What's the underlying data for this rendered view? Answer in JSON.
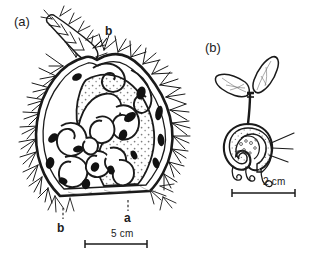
{
  "figure": {
    "background_color": "#ffffff",
    "ink_color": "#1a1a1a",
    "stipple_color": "#8a8a8a",
    "panels": [
      {
        "tag": "(a)",
        "description": "longitudinal section of spiny fruit with convoluted folded embryo",
        "pointer_labels": [
          {
            "text": "b",
            "target": "spiny-beak-appendage"
          },
          {
            "text": "b",
            "target": "lower-seed-chamber"
          },
          {
            "text": "a",
            "target": "stippled-endosperm-body"
          }
        ],
        "scale_bar": {
          "label": "5 cm",
          "length_px": 62
        }
      },
      {
        "tag": "(b)",
        "description": "germinating seedling with two cotyledons emerging from seed",
        "pointer_labels": [],
        "scale_bar": {
          "label": "2 cm",
          "length_px": 63
        }
      }
    ]
  }
}
